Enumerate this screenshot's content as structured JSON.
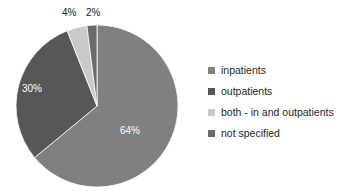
{
  "chart_data": {
    "type": "pie",
    "title": "",
    "subtitle": "",
    "xlabel": "",
    "ylabel": "",
    "categories": [
      "inpatients",
      "outpatients",
      "both - in and outpatients",
      "not specified"
    ],
    "values": [
      64,
      30,
      4,
      2
    ],
    "value_labels": [
      "64%",
      "30%",
      "4%",
      "2%"
    ],
    "value_unit": "%",
    "slice_colors": [
      "#808080",
      "#575757",
      "#c9c9c9",
      "#6b6b6b"
    ],
    "label_colors": [
      "#ffffff",
      "#ffffff",
      "#1a1a1a",
      "#1a1a1a"
    ],
    "label_placement": [
      "inside",
      "inside",
      "outside",
      "outside"
    ],
    "start_angle_deg": 0,
    "direction": "clockwise",
    "legend": {
      "position": "right",
      "entries": [
        {
          "label": "inpatients",
          "color": "#808080"
        },
        {
          "label": "outpatients",
          "color": "#575757"
        },
        {
          "label": "both - in and outpatients",
          "color": "#c9c9c9"
        },
        {
          "label": "not specified",
          "color": "#6b6b6b"
        }
      ]
    },
    "grid": false,
    "background": "#ffffff"
  },
  "geometry": {
    "center_x": 97,
    "center_y": 106,
    "radius": 81
  }
}
